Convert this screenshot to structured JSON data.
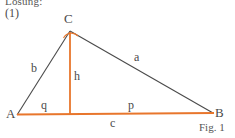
{
  "header": {
    "title": "Lösung:",
    "step_label": "(1)"
  },
  "figure": {
    "caption": "Fig. 1",
    "colors": {
      "outline": "#4a4a4a",
      "highlight": "#e8762c",
      "background": "#ffffff",
      "text": "#4a4a4a"
    },
    "vertices": [
      {
        "name": "A",
        "label": "A",
        "x": 17,
        "y": 115
      },
      {
        "name": "B",
        "label": "B",
        "x": 213,
        "y": 113
      },
      {
        "name": "C",
        "label": "C",
        "x": 70,
        "y": 31
      }
    ],
    "foot_of_altitude": {
      "name": "F",
      "x": 70,
      "y": 114
    },
    "edges": [
      {
        "name": "side-b",
        "label": "b",
        "from": "A",
        "to": "C",
        "style": "outline"
      },
      {
        "name": "side-a",
        "label": "a",
        "from": "C",
        "to": "B",
        "style": "outline"
      },
      {
        "name": "side-c",
        "label": "c",
        "from": "A",
        "to": "B",
        "style": "highlight"
      },
      {
        "name": "altitude-h",
        "label": "h",
        "from": "C",
        "to": "F",
        "style": "highlight"
      }
    ],
    "segments": [
      {
        "name": "segment-q",
        "label": "q",
        "from": "A",
        "to": "F"
      },
      {
        "name": "segment-p",
        "label": "p",
        "from": "F",
        "to": "B"
      }
    ],
    "angle_marker": {
      "name": "angle-at-c",
      "at": "C",
      "style": "arc",
      "color": "#e8762c"
    }
  }
}
